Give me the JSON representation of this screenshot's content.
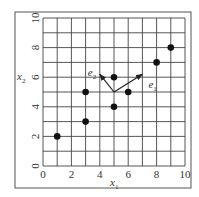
{
  "chart_data": {
    "type": "scatter",
    "title": "",
    "xlabel": "x",
    "xlabel_sub": "1",
    "ylabel": "x",
    "ylabel_sub": "2",
    "xlim": [
      0,
      10
    ],
    "ylim": [
      0,
      10
    ],
    "grid": true,
    "grid_step": 1,
    "xticks": [
      "0",
      "2",
      "4",
      "6",
      "8",
      "10"
    ],
    "yticks": [
      "0",
      "2",
      "4",
      "6",
      "8",
      "10"
    ],
    "points": [
      {
        "x": 1,
        "y": 2
      },
      {
        "x": 3,
        "y": 3
      },
      {
        "x": 3,
        "y": 5
      },
      {
        "x": 5,
        "y": 4
      },
      {
        "x": 5,
        "y": 6
      },
      {
        "x": 6,
        "y": 5
      },
      {
        "x": 8,
        "y": 7
      },
      {
        "x": 9,
        "y": 8
      }
    ],
    "vectors": [
      {
        "name": "e",
        "sub": "1",
        "from": [
          5,
          5
        ],
        "to": [
          7,
          6.2
        ]
      },
      {
        "name": "e",
        "sub": "2",
        "from": [
          5,
          5
        ],
        "to": [
          4,
          6.2
        ]
      }
    ]
  }
}
